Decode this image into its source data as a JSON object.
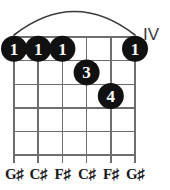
{
  "diagram": {
    "kind": "guitar-chord-diagram",
    "position_label": "IV",
    "string_count": 6,
    "fret_count": 5,
    "colors": {
      "dot_fill": "#111111",
      "dot_text": "#ffffff",
      "grid": "#6e6e6e",
      "nut_barre": "#3a3a3a",
      "label_text": "#1a1a1a"
    },
    "barre": {
      "present": true,
      "from_string": 1,
      "to_string": 6,
      "fret": 1,
      "style": "arc"
    },
    "dots": [
      {
        "id": "dot-1",
        "finger": "1",
        "string": 1,
        "fret": 1
      },
      {
        "id": "dot-2",
        "finger": "1",
        "string": 2,
        "fret": 1
      },
      {
        "id": "dot-3",
        "finger": "1",
        "string": 3,
        "fret": 1
      },
      {
        "id": "dot-4",
        "finger": "1",
        "string": 6,
        "fret": 1
      },
      {
        "id": "dot-5",
        "finger": "3",
        "string": 4,
        "fret": 2
      },
      {
        "id": "dot-6",
        "finger": "4",
        "string": 5,
        "fret": 3
      }
    ],
    "note_labels": [
      {
        "string": 1,
        "text": "G♯"
      },
      {
        "string": 2,
        "text": "C♯"
      },
      {
        "string": 3,
        "text": "F♯"
      },
      {
        "string": 4,
        "text": "C♯"
      },
      {
        "string": 5,
        "text": "F♯"
      },
      {
        "string": 6,
        "text": "G♯"
      }
    ]
  }
}
